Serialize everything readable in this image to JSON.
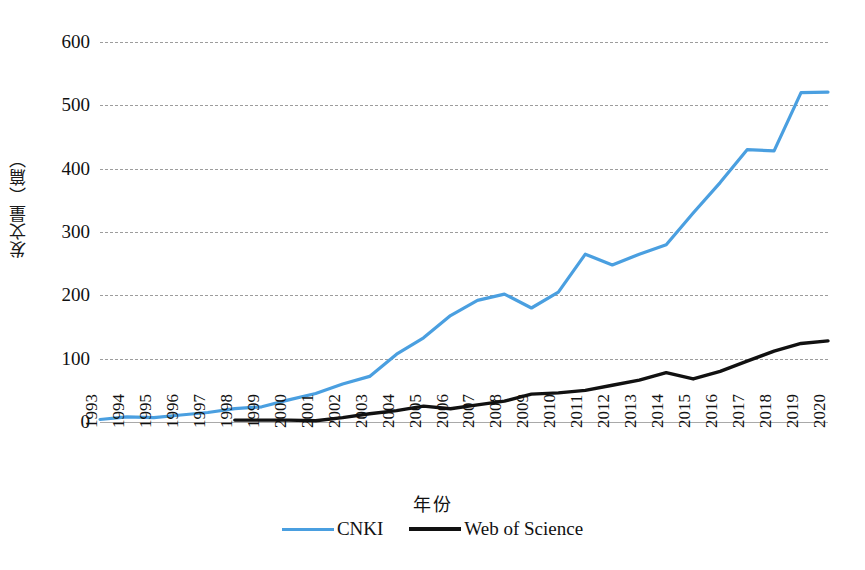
{
  "chart_data": {
    "type": "line",
    "title": "",
    "xlabel": "年份",
    "ylabel": "发文量（篇）",
    "ylim": [
      0,
      600
    ],
    "yticks": [
      0,
      100,
      200,
      300,
      400,
      500,
      600
    ],
    "ytick_labels": [
      "0",
      "100",
      "200",
      "300",
      "400",
      "500",
      "600"
    ],
    "grid": true,
    "legend_position": "bottom-center",
    "categories": [
      "1993",
      "1994",
      "1995",
      "1996",
      "1997",
      "1998",
      "1999",
      "2000",
      "2001",
      "2002",
      "2003",
      "2004",
      "2005",
      "2006",
      "2007",
      "2008",
      "2009",
      "2010",
      "2011",
      "2012",
      "2013",
      "2014",
      "2015",
      "2016",
      "2017",
      "2018",
      "2019",
      "2020"
    ],
    "series": [
      {
        "name": "CNKI",
        "color": "#4A9FE0",
        "values": [
          2,
          3,
          4,
          8,
          7,
          11,
          15,
          21,
          24,
          35,
          45,
          60,
          72,
          107,
          133,
          168,
          192,
          202,
          180,
          205,
          232,
          265,
          248,
          265,
          280,
          330,
          378,
          432
        ]
      },
      {
        "name": "Web of Science",
        "color": "#111111",
        "values": [
          null,
          null,
          null,
          null,
          null,
          3,
          3,
          3,
          2,
          7,
          13,
          18,
          25,
          21,
          27,
          33,
          44,
          46,
          50,
          58,
          66,
          78,
          68,
          80,
          96,
          112,
          124,
          128
        ]
      }
    ],
    "series_extra": {
      "note": "x axis spans 1993-2020; CNKI values continue to 430, 428, 520, 521 at 2017-2020 and Web of Science to 124, 140, 170, 183",
      "cnki_full": [
        2,
        3,
        4,
        8,
        7,
        11,
        15,
        21,
        24,
        35,
        45,
        60,
        72,
        107,
        133,
        168,
        192,
        202,
        180,
        205,
        265,
        248,
        265,
        280,
        330,
        378,
        430,
        428,
        520,
        521
      ]
    }
  },
  "legend": {
    "items": [
      {
        "label": "CNKI",
        "color": "#4A9FE0"
      },
      {
        "label": "Web of Science",
        "color": "#111111"
      }
    ]
  }
}
